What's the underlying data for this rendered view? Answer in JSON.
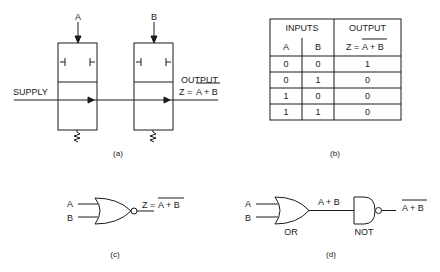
{
  "figure_a": {
    "caption": "(a)",
    "input_a": "A",
    "input_b": "B",
    "supply_label": "SUPPLY",
    "output_label": "OUTPUT",
    "output_expr_prefix": "Z = ",
    "output_expr_overlined": "A + B"
  },
  "figure_b": {
    "caption": "(b)",
    "header_inputs": "INPUTS",
    "header_output": "OUTPUT",
    "col_a": "A",
    "col_b": "B",
    "col_z_prefix": "Z = ",
    "col_z_overlined": "A + B",
    "rows": [
      {
        "a": "0",
        "b": "0",
        "z": "1"
      },
      {
        "a": "0",
        "b": "1",
        "z": "0"
      },
      {
        "a": "1",
        "b": "0",
        "z": "0"
      },
      {
        "a": "1",
        "b": "1",
        "z": "0"
      }
    ]
  },
  "figure_c": {
    "caption": "(c)",
    "input_a": "A",
    "input_b": "B",
    "output_prefix": "Z = ",
    "output_overlined": "A + B"
  },
  "figure_d": {
    "caption": "(d)",
    "input_a": "A",
    "input_b": "B",
    "mid_label": "A + B",
    "or_label": "OR",
    "not_label": "NOT",
    "output_overlined": "A + B"
  }
}
